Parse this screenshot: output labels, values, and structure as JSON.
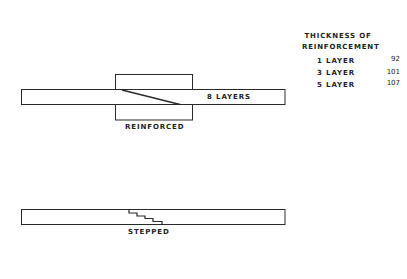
{
  "figure": {
    "reinforced": {
      "bar_label": "8 LAYERS",
      "caption": "REINFORCED"
    },
    "stepped": {
      "caption": "STEPPED"
    },
    "legend": {
      "title_line1": "THICKNESS OF",
      "title_line2": "REINFORCEMENT",
      "rows": [
        {
          "label": "1 LAYER",
          "value": "92"
        },
        {
          "label": "3 LAYER",
          "value": "101"
        },
        {
          "label": "5 LAYER",
          "value": "107"
        }
      ]
    },
    "colors": {
      "line": "#2a2a2a",
      "background": "#ffffff"
    }
  }
}
